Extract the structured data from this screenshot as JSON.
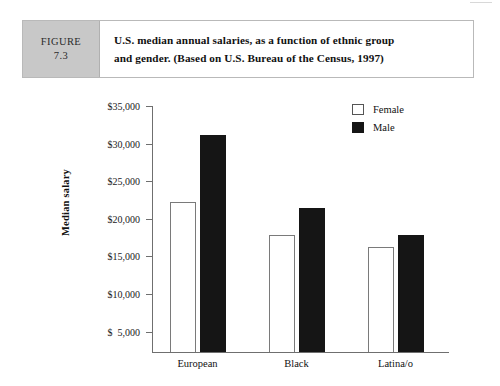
{
  "figure": {
    "label_word": "FIGURE",
    "number": "7.3",
    "caption_line_1": "U.S. median annual salaries, as a function of ethnic group",
    "caption_line_2": "and gender. (Based on U.S. Bureau of the Census, 1997)"
  },
  "chart_data": {
    "type": "bar",
    "title": "",
    "xlabel": "",
    "ylabel": "Median salary",
    "categories": [
      "European",
      "Black",
      "Latina/o"
    ],
    "series": [
      {
        "name": "Female",
        "color": "#ffffff",
        "values": [
          22300,
          17800,
          16300
        ]
      },
      {
        "name": "Male",
        "color": "#151515",
        "values": [
          31200,
          21400,
          17800
        ]
      }
    ],
    "ylim": [
      2300,
      35000
    ],
    "ytick_values": [
      35000,
      30000,
      25000,
      20000,
      15000,
      10000,
      5000
    ],
    "ytick_labels": [
      "$35,000",
      "$30,000",
      "$25,000",
      "$20,000",
      "$15,000",
      "$10,000",
      "$  5,000"
    ],
    "grid": false,
    "legend_position": "top-right",
    "legend": [
      "Female",
      "Male"
    ]
  }
}
